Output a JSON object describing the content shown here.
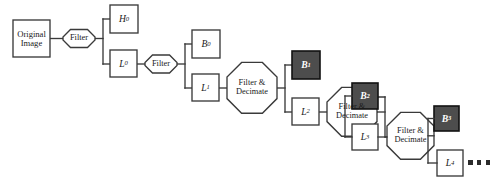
{
  "figure": {
    "type": "block-flow-diagram",
    "background_color": "#ffffff",
    "stroke_color": "#3a3a3a",
    "band_dark_fill": "#4d4d4d",
    "band_light_fill": "#ffffff",
    "text_color": "#1a1a1a",
    "dark_band_text_color": "#ffffff"
  },
  "nodes": {
    "original_image": {
      "line1": "Original",
      "line2": "Image",
      "shape": "rectangle"
    },
    "filter_0": {
      "label": "Filter",
      "shape": "octagon"
    },
    "filter_1": {
      "label": "Filter",
      "shape": "octagon"
    },
    "h0": {
      "base": "H",
      "sub": "0",
      "shape": "rectangle",
      "fill": "light"
    },
    "l0": {
      "base": "L",
      "sub": "0",
      "shape": "rectangle",
      "fill": "light"
    },
    "b0": {
      "base": "B",
      "sub": "0",
      "shape": "rectangle",
      "fill": "light"
    },
    "l1": {
      "base": "L",
      "sub": "1",
      "shape": "rectangle",
      "fill": "light"
    },
    "fd_1": {
      "line1": "Filter &",
      "line2": "Decimate",
      "shape": "octagon"
    },
    "b1": {
      "base": "B",
      "sub": "1",
      "shape": "rectangle",
      "fill": "dark"
    },
    "l2": {
      "base": "L",
      "sub": "2",
      "shape": "rectangle",
      "fill": "light"
    },
    "fd_2": {
      "line1": "Filter &",
      "line2": "Decimate",
      "shape": "octagon"
    },
    "b2": {
      "base": "B",
      "sub": "2",
      "shape": "rectangle",
      "fill": "dark"
    },
    "l3": {
      "base": "L",
      "sub": "3",
      "shape": "rectangle",
      "fill": "light"
    },
    "fd_3": {
      "line1": "Filter &",
      "line2": "Decimate",
      "shape": "octagon"
    },
    "b3": {
      "base": "B",
      "sub": "3",
      "shape": "rectangle",
      "fill": "dark"
    },
    "l4": {
      "base": "L",
      "sub": "4",
      "shape": "rectangle",
      "fill": "light"
    },
    "continuation": {
      "label": "...",
      "dot_count": 3
    }
  },
  "flow_sequence": [
    "Original Image",
    "Filter",
    "H0 / L0",
    "Filter",
    "B0 / L1",
    "Filter & Decimate",
    "B1 / L2",
    "Filter & Decimate",
    "B2 / L3",
    "Filter & Decimate",
    "B3 / L4",
    "..."
  ]
}
